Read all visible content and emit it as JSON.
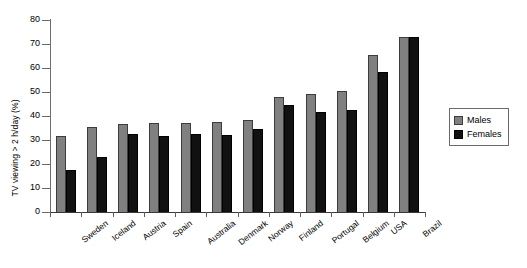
{
  "chart_data": {
    "type": "bar",
    "title": "",
    "subtitle": "",
    "xlabel": "",
    "ylabel": "TV viewing > 2 h/day (%)",
    "ylim": [
      0,
      80
    ],
    "yticks": [
      0,
      10,
      20,
      30,
      40,
      50,
      60,
      70,
      80
    ],
    "grid": false,
    "legend_position": "right",
    "categories": [
      "Sweden",
      "Iceland",
      "Austria",
      "Spain",
      "Australia",
      "Denmark",
      "Norway",
      "Finland",
      "Portugal",
      "Belgium",
      "USA",
      "Brazil"
    ],
    "series": [
      {
        "name": "Males",
        "color": "#808080",
        "values": [
          31.5,
          35.5,
          36.5,
          37.0,
          37.0,
          37.5,
          38.5,
          48.0,
          49.0,
          50.5,
          65.5,
          73.0
        ]
      },
      {
        "name": "Females",
        "color": "#111111",
        "values": [
          17.5,
          23.0,
          32.5,
          31.5,
          32.5,
          32.0,
          34.5,
          44.5,
          41.5,
          42.5,
          58.5,
          73.0
        ]
      }
    ]
  },
  "legend": {
    "items": [
      {
        "label": "Males",
        "color": "#808080"
      },
      {
        "label": "Females",
        "color": "#111111"
      }
    ]
  }
}
